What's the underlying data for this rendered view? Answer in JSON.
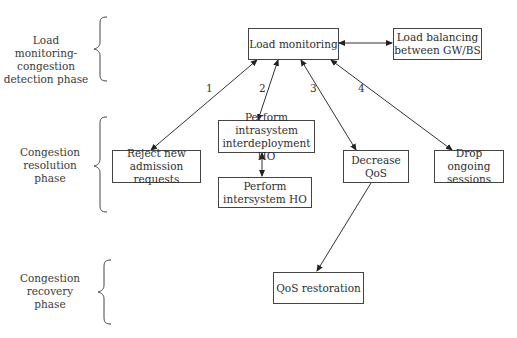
{
  "diagram": {
    "phases": [
      {
        "id": "detection",
        "label_lines": [
          "Load monitoring-",
          "congestion",
          "detection phase"
        ]
      },
      {
        "id": "resolution",
        "label_lines": [
          "Congestion",
          "resolution",
          "phase"
        ]
      },
      {
        "id": "recovery",
        "label_lines": [
          "Congestion",
          "recovery",
          "phase"
        ]
      }
    ],
    "nodes": {
      "load_monitoring": {
        "line1": "Load monitoring",
        "line2": ""
      },
      "load_balancing": {
        "line1": "Load balancing",
        "line2": "between GW/BS"
      },
      "reject_admission": {
        "line1": "Reject new",
        "line2": "admission requests"
      },
      "intrasystem_ho": {
        "line1": "Perform intrasystem",
        "line2": "interdeployment HO"
      },
      "intersystem_ho": {
        "line1": "Perform",
        "line2": "intersystem HO"
      },
      "decrease_qos": {
        "line1": "Decrease QoS",
        "line2": ""
      },
      "drop_sessions": {
        "line1": "Drop ongoing",
        "line2": "sessions"
      },
      "qos_restoration": {
        "line1": "QoS restoration",
        "line2": ""
      }
    },
    "edge_labels": {
      "e1": "1",
      "e2": "2",
      "e3": "3",
      "e4": "4"
    },
    "edges": [
      {
        "from": "load_monitoring",
        "to": "load_balancing",
        "type": "bidirectional"
      },
      {
        "from": "load_monitoring",
        "to": "reject_admission",
        "type": "bidirectional",
        "label": "1"
      },
      {
        "from": "load_monitoring",
        "to": "intrasystem_ho",
        "type": "bidirectional",
        "label": "2"
      },
      {
        "from": "load_monitoring",
        "to": "decrease_qos",
        "type": "bidirectional",
        "label": "3"
      },
      {
        "from": "load_monitoring",
        "to": "drop_sessions",
        "type": "bidirectional",
        "label": "4"
      },
      {
        "from": "intrasystem_ho",
        "to": "intersystem_ho",
        "type": "bidirectional"
      },
      {
        "from": "decrease_qos",
        "to": "qos_restoration",
        "type": "directed"
      }
    ],
    "colors": {
      "line": "#333333",
      "text": "#2e2e2e",
      "background": "#ffffff"
    }
  }
}
